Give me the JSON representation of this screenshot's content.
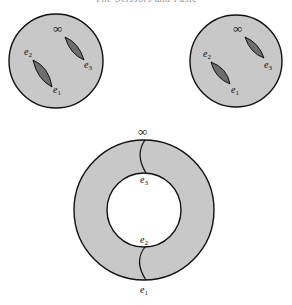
{
  "caption": "The Scissors and Paste",
  "colors": {
    "fill": "#c8c8c8",
    "slit": "#6e6e6e",
    "stroke": "#111111",
    "background": "#ffffff"
  },
  "diagrams": [
    {
      "name": "left-sphere",
      "labels": {
        "infinity": "∞",
        "e1": "e",
        "e1_sub": "1",
        "e2": "e",
        "e2_sub": "2",
        "e3": "e",
        "e3_sub": "3"
      }
    },
    {
      "name": "right-sphere",
      "labels": {
        "infinity": "∞",
        "e1": "e",
        "e1_sub": "1",
        "e2": "e",
        "e2_sub": "2",
        "e3": "e",
        "e3_sub": "3"
      }
    },
    {
      "name": "torus-annulus",
      "labels": {
        "infinity": "∞",
        "e1": "e",
        "e1_sub": "1",
        "e2": "e",
        "e2_sub": "2",
        "e3": "e",
        "e3_sub": "3"
      }
    }
  ]
}
